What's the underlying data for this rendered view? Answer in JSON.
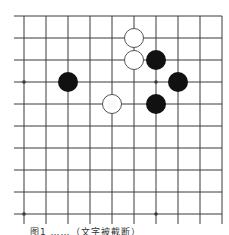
{
  "board": {
    "size": 10,
    "origin": {
      "x": 24,
      "y": 16
    },
    "spacing": 22,
    "line_color": "#3a3a3a",
    "line_extend_left": 10,
    "line_extend_bottom": 10,
    "star_points": [
      {
        "col": 0,
        "row": 3
      },
      {
        "col": 6,
        "row": 3
      },
      {
        "col": 0,
        "row": 9
      },
      {
        "col": 6,
        "row": 9
      }
    ],
    "stone_radius": 10,
    "colors": {
      "black": "#111111",
      "white_fill": "#ffffff",
      "white_stroke": "#555555"
    },
    "stones": [
      {
        "color": "white",
        "col": 5,
        "row": 1
      },
      {
        "color": "white",
        "col": 5,
        "row": 2
      },
      {
        "color": "black",
        "col": 6,
        "row": 2
      },
      {
        "color": "black",
        "col": 2,
        "row": 3
      },
      {
        "color": "black",
        "col": 7,
        "row": 3
      },
      {
        "color": "white",
        "col": 4,
        "row": 4
      },
      {
        "color": "black",
        "col": 6,
        "row": 4
      }
    ]
  },
  "caption": {
    "text": "图1  ……（文字被截断）"
  }
}
